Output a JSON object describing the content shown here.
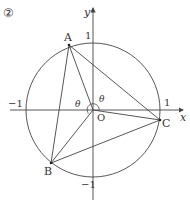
{
  "figure": {
    "number_label": "②",
    "axes": {
      "x_label": "x",
      "y_label": "y",
      "origin_label": "O",
      "tick_pos_x": "1",
      "tick_neg_x": "−1",
      "tick_pos_y": "1",
      "tick_neg_y": "−1"
    },
    "unit_circle": {
      "center": [
        0,
        0
      ],
      "radius": 1
    },
    "points": [
      {
        "name": "A",
        "label": "A"
      },
      {
        "name": "B",
        "label": "B"
      },
      {
        "name": "C",
        "label": "C"
      }
    ],
    "angle_labels": [
      "θ",
      "θ"
    ],
    "segments": [
      "AB",
      "BC",
      "CA",
      "OA",
      "OB",
      "OC"
    ],
    "colors": {
      "stroke": "#444444",
      "text": "#333333",
      "background": "#ffffff"
    }
  }
}
